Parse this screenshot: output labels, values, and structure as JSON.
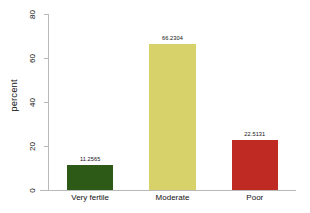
{
  "chart_data": {
    "type": "bar",
    "title": "",
    "subtitle": "",
    "xlabel": "",
    "ylabel": "percent",
    "categories": [
      "Very fertile",
      "Moderate",
      "Poor"
    ],
    "values": [
      11.2565,
      66.2304,
      22.5131
    ],
    "value_labels": [
      "11.2565",
      "66.2304",
      "22.5131"
    ],
    "bar_colors": [
      "#2d5a16",
      "#d8d26a",
      "#bf2b22"
    ],
    "ylim": [
      0,
      80
    ],
    "yticks": [
      0,
      20,
      40,
      60,
      80
    ],
    "ytick_labels": [
      "0",
      "20",
      "40",
      "60",
      "80"
    ],
    "grid": false,
    "legend": false,
    "legend_position": "none",
    "axis_color": "#b9b9b9",
    "background_color": "#ffffff",
    "text_color": "#111111"
  }
}
